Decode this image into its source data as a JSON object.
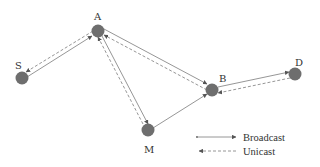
{
  "diagram": {
    "type": "network-routing",
    "nodes": [
      {
        "id": "S",
        "label": "S",
        "x": 22,
        "y": 78
      },
      {
        "id": "A",
        "label": "A",
        "x": 98,
        "y": 31
      },
      {
        "id": "B",
        "label": "B",
        "x": 212,
        "y": 90
      },
      {
        "id": "D",
        "label": "D",
        "x": 295,
        "y": 74
      },
      {
        "id": "M",
        "label": "M",
        "x": 148,
        "y": 130
      }
    ],
    "edges": [
      {
        "from": "S",
        "to": "A",
        "kind": "broadcast"
      },
      {
        "from": "A",
        "to": "S",
        "kind": "unicast"
      },
      {
        "from": "A",
        "to": "B",
        "kind": "broadcast"
      },
      {
        "from": "B",
        "to": "A",
        "kind": "unicast"
      },
      {
        "from": "A",
        "to": "M",
        "kind": "broadcast"
      },
      {
        "from": "M",
        "to": "A",
        "kind": "unicast"
      },
      {
        "from": "M",
        "to": "B",
        "kind": "broadcast"
      },
      {
        "from": "B",
        "to": "D",
        "kind": "broadcast"
      },
      {
        "from": "D",
        "to": "B",
        "kind": "unicast"
      }
    ],
    "legend": {
      "broadcast_label": "Broadcast",
      "unicast_label": "Unicast"
    },
    "colors": {
      "node": "#6e6e6e",
      "edge": "#8a8a8a",
      "text": "#333333"
    }
  }
}
